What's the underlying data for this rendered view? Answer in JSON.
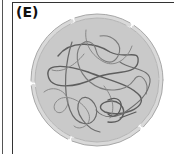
{
  "panel": {
    "label": "(E)"
  },
  "figure": {
    "colors": {
      "nucleoplasm": "#c9c9c9",
      "envelope": "#a8a8a8",
      "envelope_outer": "#d6d6d6",
      "chromatin_dark": "#5e5e5e",
      "chromatin_light": "#8a8a8a",
      "frame": "#333333"
    }
  }
}
